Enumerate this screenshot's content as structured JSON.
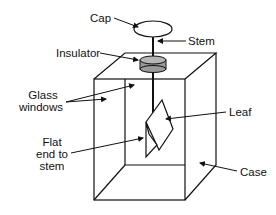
{
  "diagram": {
    "labels": {
      "cap": "Cap",
      "stem": "Stem",
      "insulator": "Insulator",
      "glass_windows_1": "Glass",
      "glass_windows_2": "windows",
      "leaf": "Leaf",
      "flat_end_1": "Flat",
      "flat_end_2": "end to",
      "flat_end_3": "stem",
      "case": "Case"
    },
    "colors": {
      "line": "#111111",
      "insulator_fill": "#9a9a9a"
    }
  }
}
